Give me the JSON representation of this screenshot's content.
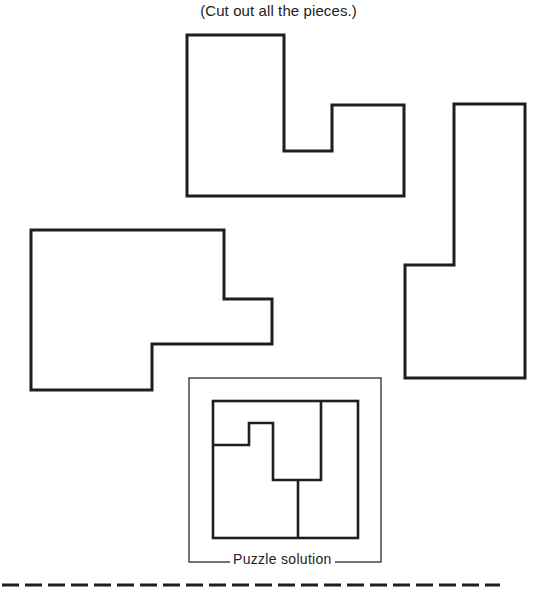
{
  "instruction": "(Cut out all the pieces.)",
  "pieces": [
    {
      "name": "piece-top-notched"
    },
    {
      "name": "piece-left-stepped"
    },
    {
      "name": "piece-right-tall"
    }
  ],
  "solution": {
    "label": "Puzzle solution"
  },
  "cut_line": {
    "style": "dashed"
  }
}
